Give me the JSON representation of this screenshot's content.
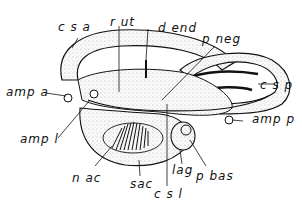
{
  "figure": {
    "type": "anatomical line drawing",
    "colors": {
      "ink": "#111111",
      "fill": "#f2f2f2",
      "background": "#ffffff"
    }
  },
  "labels": {
    "csa": "c s a",
    "rut": "r ut",
    "dend": "d end",
    "pneg": "p neg",
    "csp": "c s p",
    "ampa": "amp a",
    "ampl": "amp l",
    "ampp": "amp p",
    "nac": "n ac",
    "sac": "sac",
    "csl": "c s l",
    "lag": "lag",
    "pbas": "p bas"
  }
}
